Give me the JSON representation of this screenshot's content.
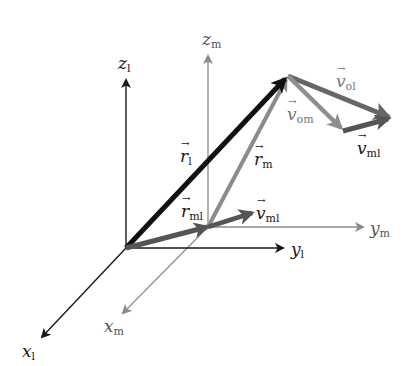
{
  "diagram": {
    "colors": {
      "frame_l": "#1a1a1a",
      "frame_m": "#8a8a8a",
      "r_l": "#111111",
      "r_m": "#8c8c8c",
      "r_ml": "#555555",
      "v_ml": "#555555",
      "v_ol": "#666666",
      "v_om": "#8e8e8e"
    },
    "frames": {
      "l": {
        "origin": [
          126,
          248
        ],
        "axes": [
          {
            "name": "z",
            "subscript": "l",
            "tip": [
              126,
              76
            ]
          },
          {
            "name": "y",
            "subscript": "l",
            "tip": [
              285,
              248
            ]
          },
          {
            "name": "x",
            "subscript": "l",
            "tip": [
              40,
              340
            ]
          }
        ]
      },
      "m": {
        "origin": [
          208,
          227
        ],
        "axes": [
          {
            "name": "z",
            "subscript": "m",
            "tip": [
              208,
              52
            ]
          },
          {
            "name": "y",
            "subscript": "m",
            "tip": [
              365,
              227
            ]
          },
          {
            "name": "x",
            "subscript": "m",
            "tip": [
              121,
              316
            ]
          }
        ]
      }
    },
    "vectors": [
      {
        "name": "r",
        "subscript": "l",
        "from": [
          126,
          248
        ],
        "to": [
          288,
          76
        ]
      },
      {
        "name": "r",
        "subscript": "m",
        "from": [
          208,
          227
        ],
        "to": [
          288,
          76
        ]
      },
      {
        "name": "r",
        "subscript": "ml",
        "from": [
          126,
          248
        ],
        "to": [
          208,
          227
        ]
      },
      {
        "name": "v",
        "subscript": "ml",
        "from": [
          208,
          227
        ],
        "to": [
          250,
          213
        ]
      },
      {
        "name": "v",
        "subscript": "ol",
        "from": [
          288,
          76
        ],
        "to": [
          391,
          118
        ]
      },
      {
        "name": "v",
        "subscript": "om",
        "from": [
          288,
          76
        ],
        "to": [
          343,
          130
        ]
      },
      {
        "name": "v",
        "subscript": "ml",
        "from": [
          343,
          130
        ],
        "to": [
          391,
          118
        ]
      }
    ],
    "labels": {
      "z_l": {
        "main": "z",
        "sub": "l"
      },
      "y_l": {
        "main": "y",
        "sub": "l"
      },
      "x_l": {
        "main": "x",
        "sub": "l"
      },
      "z_m": {
        "main": "z",
        "sub": "m"
      },
      "y_m": {
        "main": "y",
        "sub": "m"
      },
      "x_m": {
        "main": "x",
        "sub": "m"
      },
      "r_l": {
        "main": "r",
        "sub": "l"
      },
      "r_m": {
        "main": "r",
        "sub": "m"
      },
      "r_ml": {
        "main": "r",
        "sub": "ml"
      },
      "v_ml_origin": {
        "main": "v",
        "sub": "ml"
      },
      "v_ol": {
        "main": "v",
        "sub": "ol"
      },
      "v_om": {
        "main": "v",
        "sub": "om"
      },
      "v_ml_tip": {
        "main": "v",
        "sub": "ml"
      }
    }
  }
}
